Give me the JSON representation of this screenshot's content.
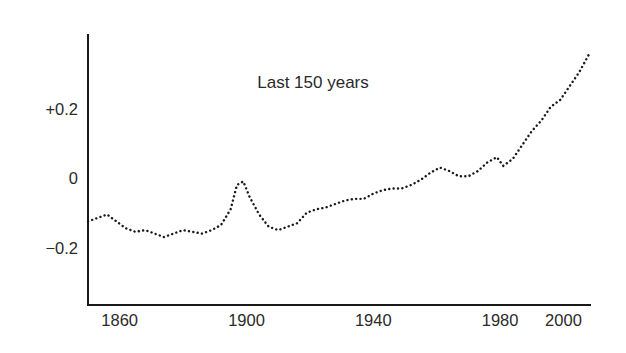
{
  "chart_data": {
    "type": "line",
    "title": "Last 150 years",
    "xlabel": "",
    "ylabel": "",
    "xlim": [
      1850,
      2009
    ],
    "ylim": [
      -0.32,
      0.42
    ],
    "grid": false,
    "legend": null,
    "style": "dotted-line",
    "xticks": [
      1860,
      1900,
      1940,
      1980,
      2000
    ],
    "xtick_labels": [
      "1860",
      "1900",
      "1940",
      "1980",
      "2000"
    ],
    "yticks": [
      0.2,
      0,
      -0.2
    ],
    "ytick_labels": [
      "+0.2",
      "0",
      "−0.2"
    ],
    "series_name": "Global temperature anomaly",
    "x": [
      1850,
      1853,
      1856,
      1859,
      1862,
      1865,
      1868,
      1871,
      1874,
      1877,
      1880,
      1883,
      1886,
      1889,
      1892,
      1895,
      1897,
      1899,
      1901,
      1904,
      1907,
      1910,
      1913,
      1916,
      1919,
      1922,
      1925,
      1928,
      1931,
      1934,
      1937,
      1940,
      1943,
      1946,
      1949,
      1952,
      1955,
      1958,
      1961,
      1964,
      1967,
      1970,
      1973,
      1976,
      1979,
      1981,
      1984,
      1987,
      1990,
      1993,
      1996,
      1999,
      2002,
      2005,
      2008
    ],
    "y": [
      -0.125,
      -0.115,
      -0.105,
      -0.125,
      -0.145,
      -0.155,
      -0.15,
      -0.16,
      -0.17,
      -0.16,
      -0.15,
      -0.155,
      -0.16,
      -0.15,
      -0.135,
      -0.09,
      -0.02,
      -0.01,
      -0.055,
      -0.105,
      -0.14,
      -0.15,
      -0.14,
      -0.13,
      -0.1,
      -0.09,
      -0.085,
      -0.075,
      -0.065,
      -0.06,
      -0.06,
      -0.045,
      -0.035,
      -0.03,
      -0.03,
      -0.02,
      -0.005,
      0.015,
      0.03,
      0.02,
      0.005,
      0.005,
      0.02,
      0.045,
      0.06,
      0.035,
      0.055,
      0.095,
      0.135,
      0.165,
      0.205,
      0.225,
      0.265,
      0.305,
      0.355
    ]
  },
  "axes": {
    "xaxis_name": "year-axis",
    "yaxis_name": "temperature-anomaly-axis"
  }
}
